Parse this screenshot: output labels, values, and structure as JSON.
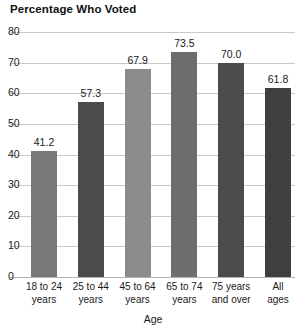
{
  "chart_data": {
    "type": "bar",
    "title": "Percentage Who Voted",
    "xlabel": "Age",
    "ylabel": "",
    "ylim": [
      0,
      80
    ],
    "yticks": [
      0,
      10,
      20,
      30,
      40,
      50,
      60,
      70,
      80
    ],
    "ytick_labels": [
      "0",
      "10",
      "20",
      "30",
      "40",
      "50",
      "60",
      "70",
      "80"
    ],
    "grid": true,
    "legend": "none",
    "categories": [
      "18 to 24 years",
      "25 to 44 years",
      "45 to 64 years",
      "65 to 74 years",
      "75 years and over",
      "All ages"
    ],
    "category_lines": [
      [
        "18 to 24",
        "years"
      ],
      [
        "25 to 44",
        "years"
      ],
      [
        "45 to 64",
        "years"
      ],
      [
        "65 to 74",
        "years"
      ],
      [
        "75 years",
        "and over"
      ],
      [
        "All",
        "ages"
      ]
    ],
    "values": [
      41.2,
      57.3,
      67.9,
      73.5,
      70.0,
      61.8
    ],
    "value_labels": [
      "41.2",
      "57.3",
      "67.9",
      "73.5",
      "70.0",
      "61.8"
    ],
    "bar_colors": [
      "#787878",
      "#4b4b4b",
      "#8c8c8c",
      "#6e6e6e",
      "#4b4b4b",
      "#3f3f3f"
    ],
    "grid_color": "#c9c9c9",
    "background": "#ffffff",
    "text_color": "#1a1a1a"
  }
}
